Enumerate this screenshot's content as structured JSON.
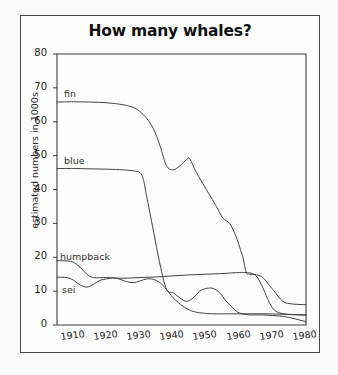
{
  "title": "How many whales?",
  "axes": {
    "ylabel": "estimated numbers in 1000s",
    "yticks": [
      "0",
      "10",
      "20",
      "30",
      "40",
      "50",
      "60",
      "70",
      "80"
    ],
    "xticks": [
      "1910",
      "1920",
      "1930",
      "1940",
      "1950",
      "1960",
      "1970",
      "1980"
    ]
  },
  "labels": {
    "fin": "fin",
    "blue": "blue",
    "humpback": "humpback",
    "sei": "sei"
  },
  "colors": {
    "line": "#3a3a3a",
    "frame": "#4a4a4a",
    "background": "#fdfdfd",
    "text": "#111111"
  },
  "chart_data": {
    "type": "line",
    "title": "How many whales?",
    "xlabel": "",
    "ylabel": "estimated numbers in 1000s",
    "xlim": [
      1905,
      1980
    ],
    "ylim": [
      0,
      80
    ],
    "grid": false,
    "legend": "inline-labels",
    "xticks": [
      1910,
      1920,
      1930,
      1940,
      1950,
      1960,
      1970,
      1980
    ],
    "yticks": [
      0,
      10,
      20,
      30,
      40,
      50,
      60,
      70,
      80
    ],
    "series": [
      {
        "name": "fin",
        "x": [
          1905,
          1910,
          1915,
          1920,
          1925,
          1928,
          1930,
          1932,
          1934,
          1936,
          1938,
          1940,
          1942,
          1944,
          1945,
          1947,
          1950,
          1953,
          1955,
          1957,
          1959,
          1960,
          1961,
          1962,
          1963,
          1965,
          1967,
          1970,
          1973,
          1976,
          1980
        ],
        "values": [
          65.8,
          65.9,
          65.8,
          65.6,
          65.0,
          64.2,
          63.0,
          61.0,
          58.0,
          53.0,
          47.0,
          45.8,
          47.0,
          48.8,
          49.0,
          45.0,
          40.0,
          35.0,
          31.5,
          30.0,
          26.0,
          23.0,
          20.0,
          15.5,
          15.0,
          14.8,
          14.0,
          10.5,
          7.0,
          6.2,
          6.0
        ]
      },
      {
        "name": "blue",
        "x": [
          1905,
          1910,
          1915,
          1920,
          1925,
          1928,
          1930,
          1931,
          1932,
          1934,
          1936,
          1938,
          1940,
          1942,
          1944,
          1946,
          1948,
          1950,
          1952,
          1954,
          1956,
          1958,
          1960,
          1963,
          1966,
          1970,
          1974,
          1980
        ],
        "values": [
          46.2,
          46.2,
          46.1,
          46.0,
          45.8,
          45.5,
          45.0,
          43.0,
          38.0,
          28.0,
          18.0,
          10.5,
          9.5,
          8.0,
          7.0,
          8.0,
          10.0,
          10.8,
          10.8,
          9.5,
          7.0,
          5.0,
          3.5,
          3.0,
          3.0,
          2.8,
          2.4,
          1.0
        ]
      },
      {
        "name": "humpback",
        "x": [
          1905,
          1908,
          1910,
          1912,
          1914,
          1916,
          1920,
          1925,
          1930,
          1935,
          1940,
          1945,
          1950,
          1955,
          1958,
          1960,
          1962,
          1963,
          1965,
          1967,
          1969,
          1971,
          1974,
          1977,
          1980
        ],
        "values": [
          19.0,
          18.9,
          18.5,
          17.0,
          15.0,
          14.0,
          14.0,
          13.8,
          14.0,
          14.2,
          14.5,
          14.8,
          15.0,
          15.2,
          15.4,
          15.5,
          15.5,
          15.4,
          14.5,
          11.0,
          6.5,
          4.0,
          3.2,
          3.0,
          2.9
        ]
      },
      {
        "name": "sei",
        "x": [
          1905,
          1908,
          1910,
          1912,
          1914,
          1916,
          1918,
          1920,
          1922,
          1924,
          1926,
          1928,
          1930,
          1932,
          1934,
          1936,
          1938,
          1940,
          1943,
          1946,
          1950,
          1953,
          1956,
          1960,
          1964,
          1968,
          1972,
          1976,
          1980
        ],
        "values": [
          14.1,
          14.0,
          13.2,
          11.8,
          11.2,
          12.0,
          13.2,
          13.6,
          13.9,
          13.5,
          12.8,
          12.5,
          13.0,
          13.6,
          13.5,
          12.5,
          10.5,
          8.0,
          5.5,
          4.0,
          3.4,
          3.3,
          3.3,
          3.3,
          3.3,
          3.3,
          3.2,
          3.1,
          3.0
        ]
      }
    ]
  }
}
